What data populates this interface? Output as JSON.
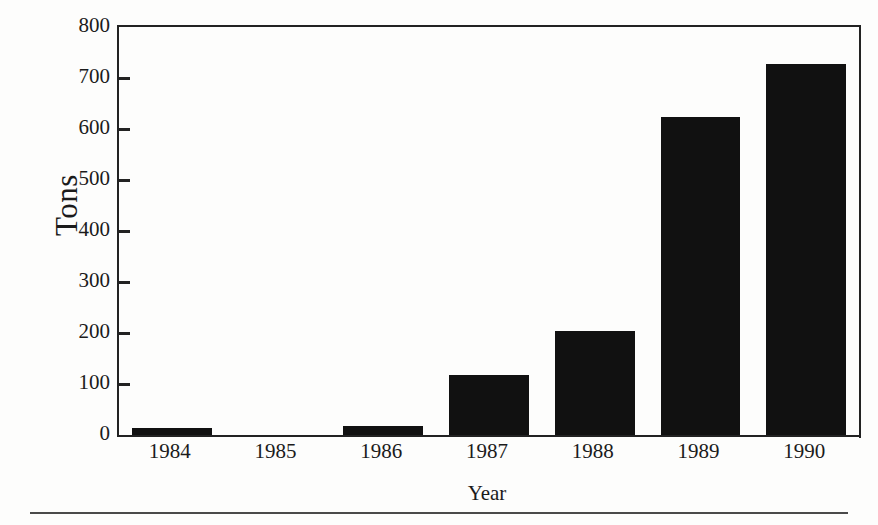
{
  "chart_data": {
    "type": "bar",
    "title": "",
    "subtitle": "",
    "categories": [
      "1984",
      "1985",
      "1986",
      "1987",
      "1988",
      "1989",
      "1990"
    ],
    "values": [
      14,
      0,
      18,
      117,
      203,
      623,
      727
    ],
    "series": [
      {
        "name": "Tons",
        "values": [
          14,
          0,
          18,
          117,
          203,
          623,
          727
        ]
      }
    ],
    "xlabel": "Year",
    "ylabel": "Tons",
    "ylim": [
      0,
      800
    ],
    "yticks": [
      0,
      100,
      200,
      300,
      400,
      500,
      600,
      700,
      800
    ],
    "ytick_labels": [
      "0",
      "100",
      "200",
      "300",
      "400",
      "500",
      "600",
      "700",
      "800"
    ],
    "grid": false,
    "legend": false,
    "legend_position": "none",
    "bar_color": "#111111",
    "axis_color": "#222222",
    "background_color": "#fdfdfc",
    "annotations": []
  },
  "figure": {
    "bottom_rule_color": "#4a4a4a"
  }
}
